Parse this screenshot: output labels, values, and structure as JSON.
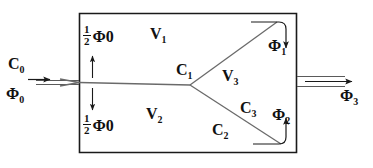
{
  "diagram": {
    "stroke_color": "#1a1a1a",
    "text_color": "#111111",
    "background": "#ffffff",
    "labels": {
      "input_current": "C",
      "input_current_sub": "0",
      "input_flux": "Φ",
      "input_flux_sub": "0",
      "half_numerator": "1",
      "half_denominator": "2",
      "half_flux_top": "Φ",
      "half_flux_top_sub": "0",
      "half_flux_bottom": "Φ",
      "half_flux_bottom_sub": "0",
      "region_v1": "V",
      "region_v1_sub": "1",
      "region_v2": "V",
      "region_v2_sub": "2",
      "region_v3": "V",
      "region_v3_sub": "3",
      "node_c1": "C",
      "node_c1_sub": "1",
      "branch_c2": "C",
      "branch_c2_sub": "2",
      "branch_c3": "C",
      "branch_c3_sub": "3",
      "flux_phi1": "Φ",
      "flux_phi1_sub": "1",
      "flux_phi2": "Φ",
      "flux_phi2_sub": "2",
      "output_flux": "Φ",
      "output_flux_sub": "3"
    }
  }
}
